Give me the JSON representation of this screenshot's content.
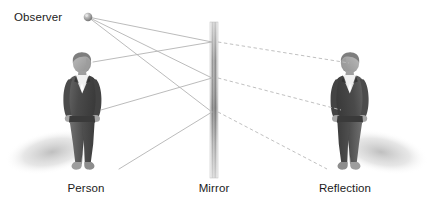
{
  "diagram": {
    "background_color": "#ffffff",
    "width": 431,
    "height": 203,
    "labels": {
      "observer": "Observer",
      "person": "Person",
      "mirror": "Mirror",
      "reflection": "Reflection"
    },
    "colors": {
      "text": "#1b1b1b",
      "incident_ray": "#b3b3b3",
      "virtual_ray": "#bdbdbd",
      "mirror_light": "#ffffff",
      "mirror_mid": "#8c8c8c",
      "mirror_dark": "#6e6e6e",
      "figure_suit": "#5a5a5a",
      "figure_suit_dark": "#3f3f3f",
      "figure_skin": "#a9a9a9",
      "figure_shirt": "#f2f2f2",
      "shadow": "#c9c9c9"
    },
    "elements": {
      "observer_point": {
        "cx": 88,
        "cy": 17,
        "r": 4.2,
        "fill": "#9a9a9a"
      },
      "mirror": {
        "x": 210,
        "y": 22,
        "width": 8,
        "height": 156
      },
      "person": {
        "x": 60,
        "y": 52,
        "width": 52,
        "height": 122,
        "facing": "right"
      },
      "reflection": {
        "x": 320,
        "y": 52,
        "width": 52,
        "height": 122,
        "facing": "left"
      }
    },
    "rays": {
      "incident_style": "solid",
      "virtual_style": "dashed",
      "incident": [
        {
          "name": "head-ray-to-mirror",
          "from": [
            88,
            17
          ],
          "to": [
            212,
            42
          ]
        },
        {
          "name": "torso-ray-to-mirror",
          "from": [
            88,
            17
          ],
          "to": [
            212,
            78
          ]
        },
        {
          "name": "foot-ray-to-mirror",
          "from": [
            88,
            17
          ],
          "to": [
            212,
            112
          ]
        },
        {
          "name": "mirror-to-person-head",
          "from": [
            212,
            42
          ],
          "to": [
            93,
            62
          ]
        },
        {
          "name": "mirror-to-person-hand",
          "from": [
            212,
            78
          ],
          "to": [
            101,
            110
          ]
        },
        {
          "name": "mirror-to-person-foot",
          "from": [
            212,
            112
          ],
          "to": [
            119,
            169
          ]
        }
      ],
      "virtual": [
        {
          "name": "virtual-ray-head",
          "from": [
            218,
            42
          ],
          "to": [
            349,
            63
          ]
        },
        {
          "name": "virtual-ray-hand",
          "from": [
            218,
            78
          ],
          "to": [
            341,
            110
          ]
        },
        {
          "name": "virtual-ray-foot",
          "from": [
            218,
            112
          ],
          "to": [
            327,
            169
          ]
        }
      ]
    },
    "label_positions": {
      "observer": {
        "x": 14,
        "y": 21,
        "anchor": "start"
      },
      "person": {
        "x": 86,
        "y": 192,
        "anchor": "middle"
      },
      "mirror": {
        "x": 214,
        "y": 192,
        "anchor": "middle"
      },
      "reflection": {
        "x": 345,
        "y": 192,
        "anchor": "middle"
      }
    }
  }
}
